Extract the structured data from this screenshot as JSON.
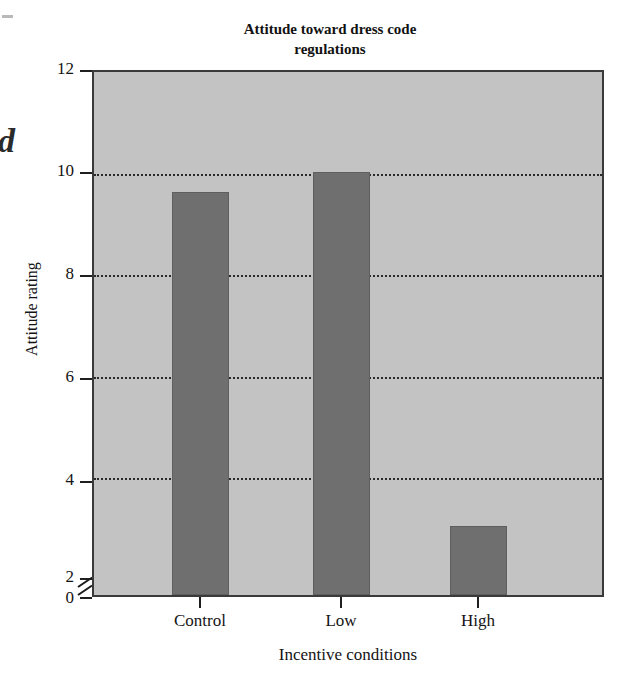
{
  "chart_data": {
    "type": "bar",
    "title": "Attitude toward dress code regulations",
    "title_line1": "Attitude toward dress code",
    "title_line2": "regulations",
    "xlabel": "Incentive conditions",
    "ylabel": "Attitude rating",
    "categories": [
      "Control",
      "Low",
      "High"
    ],
    "values": [
      9.55,
      9.95,
      2.98
    ],
    "ylim": [
      0,
      12
    ],
    "yticks": [
      0,
      2,
      4,
      6,
      8,
      10,
      12
    ],
    "ytick_labels": [
      "0",
      "2",
      "4",
      "6",
      "8",
      "10",
      "12"
    ],
    "gridlines_at": [
      4,
      6,
      8,
      10
    ],
    "grid": true,
    "axis_break": true,
    "axis_break_between": [
      0,
      2
    ],
    "legend": null,
    "series": [
      {
        "name": "Attitude rating",
        "values": [
          9.55,
          9.95,
          2.98
        ]
      }
    ],
    "colors": {
      "bar_fill": "#6f6f6f",
      "plot_background": "#c3c3c3",
      "axis": "#3a3a3a",
      "grid": "#2a2a2a",
      "text": "#141414",
      "page_background": "#ffffff"
    }
  },
  "page_artifacts": {
    "bleed_letter": "d"
  }
}
